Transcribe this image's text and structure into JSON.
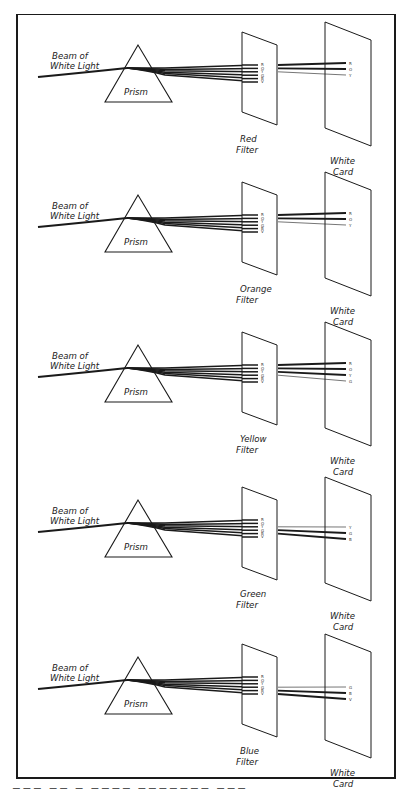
{
  "figure": {
    "spectrum_order": [
      "R",
      "O",
      "Y",
      "G",
      "B",
      "V"
    ],
    "common_labels": {
      "beam": [
        "Beam of",
        "White Light"
      ],
      "prism": "Prism",
      "card": [
        "White",
        "Card"
      ]
    },
    "panels": [
      {
        "filter_label": [
          "Red",
          "Filter"
        ],
        "filter_letters": [
          "R",
          "O",
          "Y",
          "G",
          "B",
          "V"
        ],
        "passed": [
          "R",
          "O",
          "Y"
        ],
        "strong": [
          "R",
          "O"
        ]
      },
      {
        "filter_label": [
          "Orange",
          "Filter"
        ],
        "filter_letters": [
          "R",
          "O",
          "Y",
          "G",
          "B",
          "V"
        ],
        "passed": [
          "R",
          "O",
          "Y"
        ],
        "strong": [
          "R",
          "O"
        ]
      },
      {
        "filter_label": [
          "Yellow",
          "Filter"
        ],
        "filter_letters": [
          "R",
          "O",
          "Y",
          "G",
          "B",
          "V"
        ],
        "passed": [
          "R",
          "O",
          "Y",
          "G"
        ],
        "strong": [
          "R",
          "O",
          "Y"
        ]
      },
      {
        "filter_label": [
          "Green",
          "Filter"
        ],
        "filter_letters": [
          "R",
          "O",
          "Y",
          "G",
          "B",
          "V"
        ],
        "passed": [
          "Y",
          "G",
          "B"
        ],
        "strong": [
          "G",
          "B"
        ]
      },
      {
        "filter_label": [
          "Blue",
          "Filter"
        ],
        "filter_letters": [
          "R",
          "O",
          "Y",
          "G",
          "B",
          "V"
        ],
        "passed": [
          "G",
          "B",
          "V"
        ],
        "strong": [
          "B",
          "V"
        ]
      }
    ],
    "colors": {
      "ink": "#1a1a1a",
      "paper": "#ffffff"
    }
  },
  "caption": {
    "visible": "truncated"
  }
}
